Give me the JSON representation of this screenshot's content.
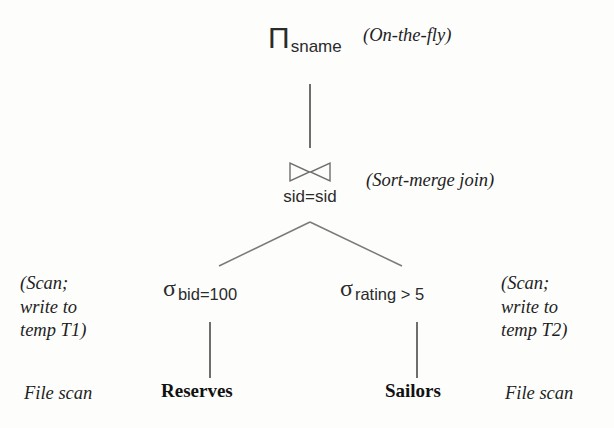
{
  "figure": {
    "type": "query-plan-tree",
    "title": "",
    "ink_color": "#1a1a1a",
    "edge_color": "#7a7a7a",
    "background": "#fdfdfc"
  },
  "nodes": {
    "project": {
      "symbol": "Π",
      "symbol_name": "projection-operator",
      "subscript": "sname"
    },
    "join": {
      "symbol": "⋈",
      "symbol_name": "bowtie-join-operator",
      "condition": "sid=sid"
    },
    "select_left": {
      "symbol": "σ",
      "symbol_name": "selection-operator",
      "subscript": "bid=100"
    },
    "select_right": {
      "symbol": "σ",
      "symbol_name": "selection-operator",
      "subscript": "rating > 5"
    },
    "relation_left": {
      "name": "Reserves"
    },
    "relation_right": {
      "name": "Sailors"
    }
  },
  "annotations": {
    "root": "(On-the-fly)",
    "join": "(Sort-merge join)",
    "left_block": "(Scan;\nwrite to\ntemp T1)",
    "right_block": "(Scan;\nwrite to\ntemp T2)",
    "left_access": "File scan",
    "right_access": "File scan"
  }
}
